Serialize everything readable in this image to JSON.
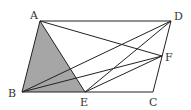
{
  "diagram": {
    "type": "geometry-parallelogram",
    "points": {
      "A": {
        "x": 40,
        "y": 21,
        "label": "A",
        "lx": 30,
        "ly": 19
      },
      "D": {
        "x": 171,
        "y": 21,
        "label": "D",
        "lx": 174,
        "ly": 20
      },
      "F": {
        "x": 162,
        "y": 56,
        "label": "F",
        "lx": 165,
        "ly": 61
      },
      "B": {
        "x": 22,
        "y": 92,
        "label": "B",
        "lx": 8,
        "ly": 97
      },
      "E": {
        "x": 85,
        "y": 92,
        "label": "E",
        "lx": 80,
        "ly": 106
      },
      "C": {
        "x": 153,
        "y": 92,
        "label": "C",
        "lx": 149,
        "ly": 106
      }
    },
    "segments": [
      [
        "A",
        "D"
      ],
      [
        "D",
        "C"
      ],
      [
        "C",
        "B"
      ],
      [
        "B",
        "A"
      ],
      [
        "A",
        "E"
      ],
      [
        "A",
        "F"
      ],
      [
        "B",
        "D"
      ],
      [
        "B",
        "F"
      ],
      [
        "E",
        "D"
      ],
      [
        "E",
        "F"
      ]
    ],
    "shaded_polygon": [
      "A",
      "B",
      "E"
    ],
    "shade_color": "#a6a6a6",
    "line_color": "#222222"
  }
}
